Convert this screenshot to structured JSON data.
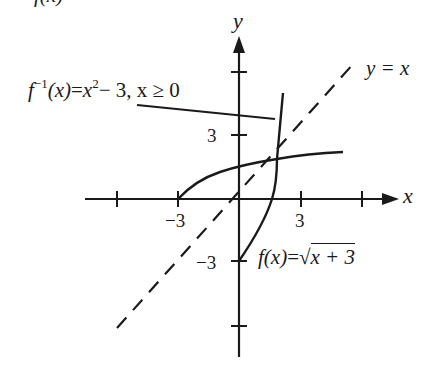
{
  "diagram": {
    "type": "function-inverse-graph",
    "top_cut_text": "f(x)",
    "axes": {
      "x_label": "x",
      "y_label": "y",
      "x_ticks": [
        -6,
        -3,
        3,
        6
      ],
      "y_ticks": [
        -6,
        -3,
        3,
        6
      ],
      "x_tick_labels": {
        "neg3": "−3",
        "pos3": "3"
      },
      "y_tick_labels": {
        "neg3": "−3",
        "pos3": "3"
      }
    },
    "curves": [
      {
        "name": "f",
        "label_fn": "f",
        "label_arg": "(x)",
        "label_eq": "=",
        "label_rhs": "x + 3",
        "sqrt_symbol": "√",
        "equation": "f(x) = √(x+3)",
        "domain": "x ≥ −3"
      },
      {
        "name": "f_inverse",
        "label_fn": "f",
        "label_sup": "−1",
        "label_arg": "(x)",
        "label_eq": "=",
        "label_rhs_base": "x",
        "label_rhs_sup": "2",
        "label_rhs_tail": "− 3, x ≥ 0",
        "equation": "f⁻¹(x) = x² − 3, x ≥ 0"
      },
      {
        "name": "identity",
        "label": "y = x",
        "style": "dashed"
      }
    ],
    "colors": {
      "ink": "#1a1a1a",
      "background": "#ffffff"
    }
  }
}
